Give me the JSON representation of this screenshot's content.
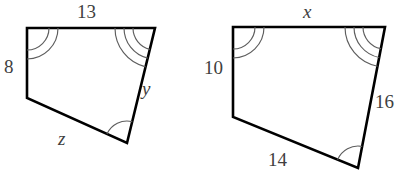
{
  "figure": {
    "background_color": "#ffffff",
    "outline_color": "#000000",
    "arc_color": "#5d5d5d",
    "label_color": "#404040",
    "shapes": [
      {
        "id": "left-quadrilateral",
        "name": "left-quadrilateral",
        "points": "27,28 155,28 127,143 27,98",
        "labels": [
          {
            "key": "top",
            "text": "13",
            "italic": false,
            "x": 77,
            "y": 2
          },
          {
            "key": "left",
            "text": "8",
            "italic": false,
            "x": 4,
            "y": 57
          },
          {
            "key": "bottom",
            "text": "z",
            "italic": true,
            "x": 58,
            "y": 129
          },
          {
            "key": "right",
            "text": "y",
            "italic": true,
            "x": 142,
            "y": 79
          }
        ],
        "angle_marks": [
          {
            "key": "top-left",
            "arcs": 2
          },
          {
            "key": "top-right",
            "arcs": 3
          },
          {
            "key": "bottom-left",
            "arcs": 1
          },
          {
            "key": "bottom-right",
            "arcs": 0
          }
        ]
      },
      {
        "id": "right-quadrilateral",
        "name": "right-quadrilateral",
        "points": "233,27 385,27 358,168 233,117",
        "labels": [
          {
            "key": "top",
            "text": "x",
            "italic": true,
            "x": 303,
            "y": 2
          },
          {
            "key": "left",
            "text": "10",
            "italic": false,
            "x": 204,
            "y": 58
          },
          {
            "key": "bottom",
            "text": "14",
            "italic": false,
            "x": 268,
            "y": 150
          },
          {
            "key": "right",
            "text": "16",
            "italic": false,
            "x": 375,
            "y": 92
          }
        ],
        "angle_marks": [
          {
            "key": "top-left",
            "arcs": 2
          },
          {
            "key": "top-right",
            "arcs": 3
          },
          {
            "key": "bottom-left",
            "arcs": 1
          },
          {
            "key": "bottom-right",
            "arcs": 0
          }
        ]
      }
    ]
  }
}
